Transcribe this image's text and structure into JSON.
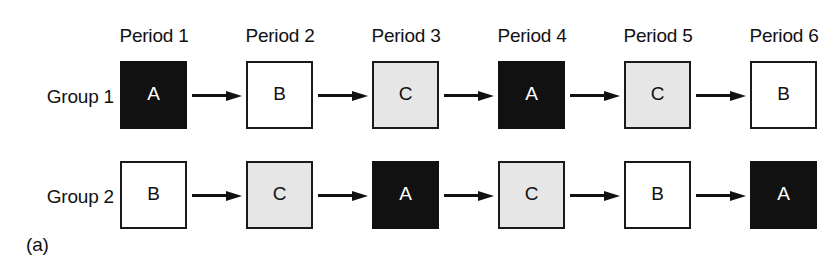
{
  "figure": {
    "subfigure_label": "(a)",
    "period_headers": [
      "Period 1",
      "Period 2",
      "Period 3",
      "Period 4",
      "Period 5",
      "Period 6"
    ],
    "rows": [
      {
        "group_label": "Group 1",
        "cells": [
          {
            "letter": "A",
            "fill": "black",
            "fill_color": "#111111",
            "text_color": "#ffffff",
            "arrow_after": true
          },
          {
            "letter": "B",
            "fill": "white",
            "fill_color": "#ffffff",
            "text_color": "#111111",
            "arrow_after": true
          },
          {
            "letter": "C",
            "fill": "gray",
            "fill_color": "#e6e6e6",
            "text_color": "#111111",
            "arrow_after": true
          },
          {
            "letter": "A",
            "fill": "black",
            "fill_color": "#111111",
            "text_color": "#ffffff",
            "arrow_after": true
          },
          {
            "letter": "C",
            "fill": "gray",
            "fill_color": "#e6e6e6",
            "text_color": "#111111",
            "arrow_after": true
          },
          {
            "letter": "B",
            "fill": "white",
            "fill_color": "#ffffff",
            "text_color": "#111111",
            "arrow_after": false
          }
        ]
      },
      {
        "group_label": "Group 2",
        "cells": [
          {
            "letter": "B",
            "fill": "white",
            "fill_color": "#ffffff",
            "text_color": "#111111",
            "arrow_after": true
          },
          {
            "letter": "C",
            "fill": "gray",
            "fill_color": "#e6e6e6",
            "text_color": "#111111",
            "arrow_after": true
          },
          {
            "letter": "A",
            "fill": "black",
            "fill_color": "#111111",
            "text_color": "#ffffff",
            "arrow_after": true
          },
          {
            "letter": "C",
            "fill": "gray",
            "fill_color": "#e6e6e6",
            "text_color": "#111111",
            "arrow_after": true
          },
          {
            "letter": "B",
            "fill": "white",
            "fill_color": "#ffffff",
            "text_color": "#111111",
            "arrow_after": true
          },
          {
            "letter": "A",
            "fill": "black",
            "fill_color": "#111111",
            "text_color": "#ffffff",
            "arrow_after": false
          }
        ]
      }
    ],
    "arrow_icon": "arrow-right-icon"
  }
}
